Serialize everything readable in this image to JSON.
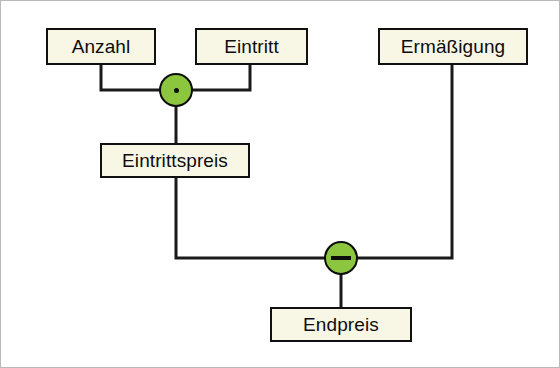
{
  "diagram": {
    "background_color": "#ffffff",
    "box_fill_color": "#f8f7e6",
    "box_border_color": "#101010",
    "operator_fill_color": "#8cc63e",
    "operator_border_color": "#0d0d0d",
    "wire_color": "#1a1a1a",
    "nodes": [
      {
        "id": "anzahl",
        "label": "Anzahl",
        "x": 46,
        "y": 28,
        "w": 110,
        "h": 37
      },
      {
        "id": "eintritt",
        "label": "Eintritt",
        "x": 195,
        "y": 28,
        "w": 113,
        "h": 37
      },
      {
        "id": "ermaessigung",
        "label": "Ermäßigung",
        "x": 378,
        "y": 28,
        "w": 150,
        "h": 37
      },
      {
        "id": "eintrittspreis",
        "label": "Eintrittspreis",
        "x": 100,
        "y": 143,
        "w": 150,
        "h": 35
      },
      {
        "id": "endpreis",
        "label": "Endpreis",
        "x": 270,
        "y": 307,
        "w": 142,
        "h": 35
      }
    ],
    "operators": [
      {
        "id": "multiply",
        "symbol": "·",
        "glyph": "dot",
        "name": "multiply-operator",
        "cx": 176,
        "cy": 90,
        "r": 17
      },
      {
        "id": "subtract",
        "symbol": "−",
        "glyph": "minus",
        "name": "subtract-operator",
        "cx": 341,
        "cy": 258,
        "r": 17
      }
    ],
    "connections": [
      {
        "id": "anzahl-to-multiply",
        "from": "anzahl",
        "to": "multiply",
        "path": "M 101 65 L 101 90 L 159 90"
      },
      {
        "id": "eintritt-to-multiply",
        "from": "eintritt",
        "to": "multiply",
        "path": "M 250 65 L 250 90 L 193 90"
      },
      {
        "id": "multiply-to-eintrittspreis",
        "from": "multiply",
        "to": "eintrittspreis",
        "path": "M 176 107 L 176 143"
      },
      {
        "id": "eintrittspreis-to-subtract",
        "from": "eintrittspreis",
        "to": "subtract",
        "path": "M 176 178 L 176 258 L 324 258"
      },
      {
        "id": "ermaessigung-to-subtract",
        "from": "ermaessigung",
        "to": "subtract",
        "path": "M 452 65 L 452 258 L 358 258"
      },
      {
        "id": "subtract-to-endpreis",
        "from": "subtract",
        "to": "endpreis",
        "path": "M 341 275 L 341 307"
      }
    ]
  }
}
